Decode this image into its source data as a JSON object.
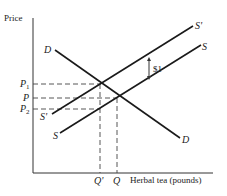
{
  "diagram": {
    "y_axis_label": "Price",
    "x_axis_label": "Herbal tea (pounds)",
    "curves": {
      "demand": "D",
      "supply": "S",
      "supply_shifted": "S'"
    },
    "price_labels": {
      "p1": "P",
      "p1_sub": "1",
      "p": "P",
      "p2": "P",
      "p2_sub": "2"
    },
    "quantity_labels": {
      "q_prime": "Q'",
      "q": "Q"
    },
    "tax_annotation": "$1"
  }
}
